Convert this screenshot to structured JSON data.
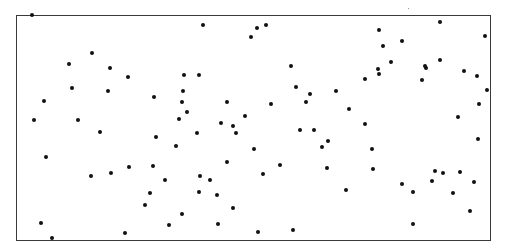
{
  "figure": {
    "frame": {
      "left": 16,
      "top": 15,
      "right": 491,
      "bottom": 241,
      "color": "#3a3a3a"
    },
    "dot_color": "#111111",
    "dot_count": 112
  },
  "points": [
    [
      32,
      15
    ],
    [
      92,
      53
    ],
    [
      69,
      64
    ],
    [
      110,
      68
    ],
    [
      128,
      77
    ],
    [
      72,
      88
    ],
    [
      108,
      91
    ],
    [
      44,
      101
    ],
    [
      154,
      97
    ],
    [
      34,
      120
    ],
    [
      78,
      120
    ],
    [
      100,
      132
    ],
    [
      46,
      157
    ],
    [
      91,
      176
    ],
    [
      111,
      173
    ],
    [
      129,
      167
    ],
    [
      41,
      223
    ],
    [
      52,
      238
    ],
    [
      125,
      233
    ],
    [
      203,
      25
    ],
    [
      184,
      75
    ],
    [
      199,
      75
    ],
    [
      183,
      91
    ],
    [
      182,
      102
    ],
    [
      227,
      102
    ],
    [
      187,
      112
    ],
    [
      179,
      119
    ],
    [
      245,
      116
    ],
    [
      221,
      123
    ],
    [
      233,
      126
    ],
    [
      156,
      137
    ],
    [
      176,
      146
    ],
    [
      197,
      133
    ],
    [
      236,
      133
    ],
    [
      153,
      166
    ],
    [
      165,
      180
    ],
    [
      227,
      162
    ],
    [
      200,
      176
    ],
    [
      210,
      180
    ],
    [
      150,
      193
    ],
    [
      199,
      192
    ],
    [
      217,
      195
    ],
    [
      145,
      205
    ],
    [
      233,
      208
    ],
    [
      182,
      214
    ],
    [
      169,
      225
    ],
    [
      218,
      224
    ],
    [
      251,
      37
    ],
    [
      257,
      28
    ],
    [
      266,
      25
    ],
    [
      291,
      66
    ],
    [
      296,
      87
    ],
    [
      310,
      94
    ],
    [
      306,
      102
    ],
    [
      336,
      91
    ],
    [
      271,
      104
    ],
    [
      365,
      79
    ],
    [
      349,
      109
    ],
    [
      378,
      69
    ],
    [
      379,
      74
    ],
    [
      379,
      30
    ],
    [
      365,
      124
    ],
    [
      300,
      130
    ],
    [
      314,
      130
    ],
    [
      322,
      147
    ],
    [
      328,
      141
    ],
    [
      254,
      149
    ],
    [
      280,
      165
    ],
    [
      263,
      174
    ],
    [
      327,
      168
    ],
    [
      373,
      169
    ],
    [
      346,
      190
    ],
    [
      258,
      232
    ],
    [
      293,
      230
    ],
    [
      383,
      46
    ],
    [
      402,
      41
    ],
    [
      391,
      62
    ],
    [
      425,
      66
    ],
    [
      426,
      68
    ],
    [
      440,
      22
    ],
    [
      440,
      60
    ],
    [
      422,
      80
    ],
    [
      464,
      71
    ],
    [
      477,
      76
    ],
    [
      485,
      36
    ],
    [
      487,
      90
    ],
    [
      479,
      104
    ],
    [
      458,
      117
    ],
    [
      478,
      139
    ],
    [
      372,
      149
    ],
    [
      435,
      171
    ],
    [
      443,
      173
    ],
    [
      460,
      172
    ],
    [
      432,
      181
    ],
    [
      402,
      184
    ],
    [
      413,
      192
    ],
    [
      474,
      182
    ],
    [
      453,
      193
    ],
    [
      470,
      211
    ],
    [
      413,
      224
    ]
  ]
}
